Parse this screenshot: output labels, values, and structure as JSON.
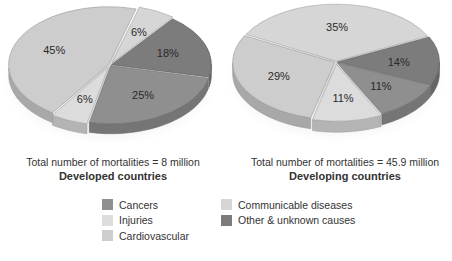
{
  "colors": {
    "Cancers": "#8f8f8f",
    "Injuries": "#dcdcdc",
    "Cardiovascular": "#cdcdcd",
    "Communicable diseases": "#d6d6d6",
    "Other & unknown causes": "#7c7c7c"
  },
  "legend": {
    "columns": [
      [
        "Cancers",
        "Injuries",
        "Cardiovascular"
      ],
      [
        "Communicable diseases",
        "Other & unknown causes"
      ]
    ]
  },
  "captions": {
    "left": {
      "total": "Total number of mortalities = 8 million",
      "title": "Developed countries"
    },
    "right": {
      "total": "Total number of mortalities = 45.9 million",
      "title": "Developing countries"
    }
  },
  "chart_data": [
    {
      "type": "pie",
      "title": "Developed countries",
      "subtitle": "Total number of mortalities = 8 million",
      "slices": [
        {
          "label": "Communicable diseases",
          "value": 6,
          "text": "6%"
        },
        {
          "label": "Other & unknown causes",
          "value": 18,
          "text": "18%"
        },
        {
          "label": "Cancers",
          "value": 25,
          "text": "25%"
        },
        {
          "label": "Injuries",
          "value": 6,
          "text": "6%"
        },
        {
          "label": "Cardiovascular",
          "value": 45,
          "text": "45%"
        }
      ]
    },
    {
      "type": "pie",
      "title": "Developing countries",
      "subtitle": "Total number of mortalities = 45.9 million",
      "slices": [
        {
          "label": "Communicable diseases",
          "value": 35,
          "text": "35%"
        },
        {
          "label": "Other & unknown causes",
          "value": 14,
          "text": "14%"
        },
        {
          "label": "Cancers",
          "value": 11,
          "text": "11%"
        },
        {
          "label": "Injuries",
          "value": 11,
          "text": "11%"
        },
        {
          "label": "Cardiovascular",
          "value": 29,
          "text": "29%"
        }
      ]
    }
  ]
}
